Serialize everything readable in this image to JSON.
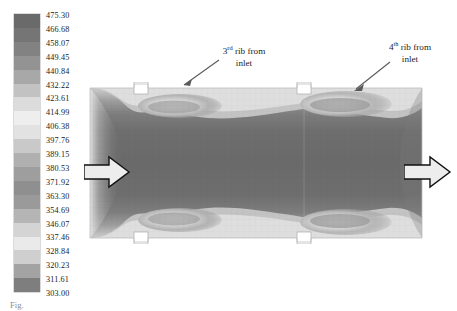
{
  "figure": {
    "kind": "temperature-contour",
    "caption_fragment": "Fig."
  },
  "colorbar": {
    "name": "temperature-colorbar",
    "unit": "K",
    "min": 303.0,
    "max": 475.3,
    "step": 8.615,
    "band_count": 20,
    "orientation": "vertical",
    "ticks": [
      "475.30",
      "466.68",
      "458.07",
      "449.45",
      "440.84",
      "432.22",
      "423.61",
      "414.99",
      "406.38",
      "397.76",
      "389.15",
      "380.53",
      "371.92",
      "363.30",
      "354.69",
      "346.07",
      "337.46",
      "328.84",
      "320.23",
      "311.61",
      "303.00"
    ],
    "band_colors": [
      "#6a6a6a",
      "#757575",
      "#828282",
      "#939393",
      "#a8a8a8",
      "#c2c2c2",
      "#dcdcdc",
      "#eeeeee",
      "#e2e2e2",
      "#c9c9c9",
      "#b0b0b0",
      "#9e9e9e",
      "#8f8f8f",
      "#9a9a9a",
      "#b5b5b5",
      "#d4d4d4",
      "#eaeaea",
      "#cfcfcf",
      "#a3a3a3",
      "#7e7e7e"
    ]
  },
  "annotations": {
    "rib3": {
      "prefix": "3",
      "sup": "rd",
      "line1": " rib from",
      "line2": "inlet"
    },
    "rib4": {
      "prefix": "4",
      "sup": "th",
      "line1": " rib from",
      "line2": "inlet"
    }
  },
  "flow": {
    "inlet_label": "inlet-flow-arrow",
    "outlet_label": "outlet-flow-arrow",
    "direction": "left-to-right"
  },
  "chart_data": {
    "type": "heatmap",
    "title": "",
    "xlabel": "",
    "ylabel": "",
    "colorbar_label": "Temperature (K)",
    "zlim": [
      303.0,
      475.3
    ],
    "contour_levels": [
      303.0,
      311.61,
      320.23,
      328.84,
      337.46,
      346.07,
      354.69,
      363.3,
      371.92,
      380.53,
      389.15,
      397.76,
      406.38,
      414.99,
      423.61,
      432.22,
      440.84,
      449.45,
      458.07,
      466.68,
      475.3
    ],
    "grid": false,
    "legend_position": "left",
    "geometry": {
      "description": "Rectangular ribbed-duct cross-section, flow left to right",
      "ribs_top": [
        {
          "label": "3rd rib from inlet",
          "x_frac": 0.16
        },
        {
          "label": "4th rib from inlet",
          "x_frac": 0.645
        }
      ],
      "ribs_bottom": [
        {
          "label": "3rd rib from inlet",
          "x_frac": 0.16
        },
        {
          "label": "4th rib from inlet",
          "x_frac": 0.645
        }
      ]
    },
    "field_regions": [
      {
        "region": "core",
        "value": 349,
        "note": "cool bulk flow, dark band"
      },
      {
        "region": "near-wall boundary layer",
        "value": 420,
        "note": "mid-grey"
      },
      {
        "region": "rib downstream recirculation",
        "value": 462,
        "note": "hottest, light grey"
      },
      {
        "region": "wall surface",
        "value": 473,
        "note": "near maximum"
      },
      {
        "region": "inlet core",
        "value": 311,
        "note": "coldest entering fluid"
      }
    ]
  }
}
